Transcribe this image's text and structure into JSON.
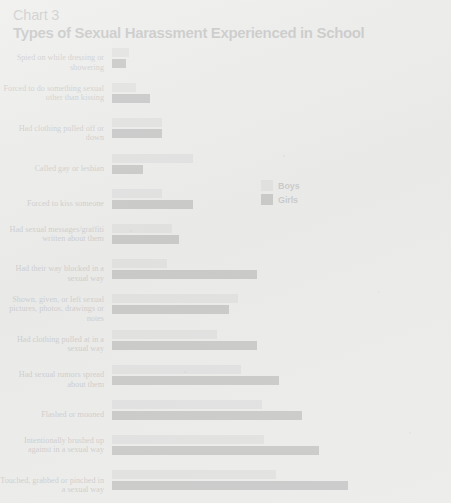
{
  "header": {
    "chart_number": "Chart 3",
    "title": "Types of Sexual Harassment Experienced in School"
  },
  "legend": {
    "position": "center-right",
    "entries": [
      {
        "label": "Boys",
        "color": "#aeaeae",
        "icon": "legend-swatch-boys"
      },
      {
        "label": "Girls",
        "color": "#151515",
        "icon": "legend-swatch-girls"
      }
    ]
  },
  "chart_data": {
    "type": "bar",
    "orientation": "horizontal",
    "title": "Types of Sexual Harassment Experienced in School",
    "subtitle": "Chart 3",
    "xlabel": "",
    "ylabel": "",
    "grid": false,
    "legend_position": "center-right",
    "xlim": [
      0,
      100
    ],
    "categories": [
      "Spied on while dressing or showering",
      "Forced to do something sexual other than kissing",
      "Had clothing pulled off or down",
      "Called gay or lesbian",
      "Forced to kiss someone",
      "Had sexual messages/graffiti written about them",
      "Had their way blocked in a sexual way",
      "Shown, given, or left sexual pictures, photos, drawings or notes",
      "Had clothing pulled at in a sexual way",
      "Had sexual rumors spread about them",
      "Flashed or mooned",
      "Intentionally brushed up against in a sexual way",
      "Touched, grabbed or pinched in a sexual way"
    ],
    "series": [
      {
        "name": "Boys",
        "color": "#aeaeae",
        "values": [
          7,
          10,
          21,
          34,
          21,
          25,
          23,
          53,
          44,
          54,
          63,
          64,
          69
        ]
      },
      {
        "name": "Girls",
        "color": "#151515",
        "values": [
          6,
          16,
          21,
          13,
          34,
          28,
          61,
          49,
          61,
          70,
          80,
          87,
          99
        ]
      }
    ]
  }
}
